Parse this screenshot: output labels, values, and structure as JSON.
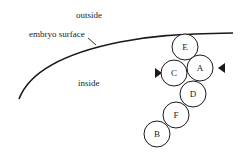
{
  "labels": {
    "outside": "outside",
    "surface": "embryo surface",
    "inside": "inside"
  },
  "cells": [
    {
      "id": "E",
      "label": "E",
      "cx": 185,
      "cy": 47
    },
    {
      "id": "C",
      "label": "C",
      "cx": 174,
      "cy": 73
    },
    {
      "id": "A",
      "label": "A",
      "cx": 200,
      "cy": 68
    },
    {
      "id": "D",
      "label": "D",
      "cx": 193,
      "cy": 94
    },
    {
      "id": "F",
      "label": "F",
      "cx": 176,
      "cy": 115
    },
    {
      "id": "B",
      "label": "B",
      "cx": 157,
      "cy": 134
    }
  ],
  "cell_radius": 13,
  "markers": [
    {
      "name": "left-arrowhead",
      "direction": "right"
    },
    {
      "name": "right-arrowhead",
      "direction": "left"
    }
  ],
  "colors": {
    "stroke": "#1a1a1a",
    "fill": "#ffffff"
  }
}
